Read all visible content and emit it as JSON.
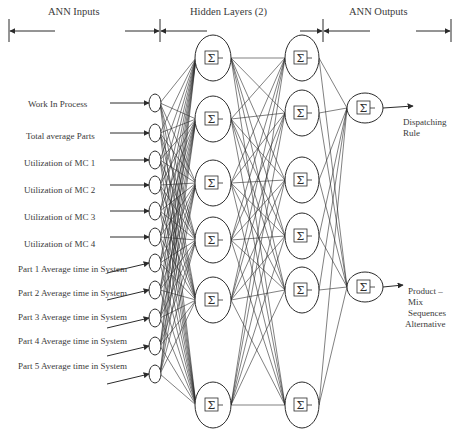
{
  "sections": {
    "inputs": "ANN Inputs",
    "hidden": "Hidden Layers (2)",
    "outputs": "ANN Outputs"
  },
  "input_labels": [
    "Work In Process",
    "Total average Parts",
    "Utilization of MC 1",
    "Utilization of MC 2",
    "Utilization of MC 3",
    "Utilization of MC 4",
    "Part 1 Average time in System",
    "Part 2 Average time in System",
    "Part 3 Average time in System",
    "Part 4 Average time in System",
    "Part 5 Average time in System"
  ],
  "output_labels": {
    "o1": [
      "Dispatching",
      "Rule"
    ],
    "o2": [
      "Product –",
      "Mix",
      "Sequences",
      "Alternative"
    ]
  },
  "node_symbol": "Σ",
  "colors": {
    "stroke": "#2b2b2b",
    "text": "#3a3a3a",
    "background": "#ffffff"
  },
  "layers": {
    "input_count": 11,
    "hidden1_count": 6,
    "hidden2_count": 6,
    "output_count": 2
  }
}
